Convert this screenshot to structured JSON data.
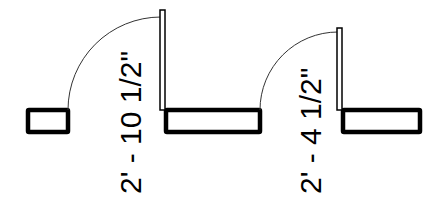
{
  "diagram": {
    "type": "architectural-door-plan",
    "colors": {
      "background": "#ffffff",
      "wall": "#000000",
      "door_leaf": "#000000",
      "swing_arc": "#333333",
      "text": "#000000"
    },
    "walls": [
      {
        "id": "wall-left",
        "x": 28,
        "y": 110,
        "w": 40,
        "h": 22
      },
      {
        "id": "wall-middle",
        "x": 166,
        "y": 110,
        "w": 94,
        "h": 22
      },
      {
        "id": "wall-right",
        "x": 343,
        "y": 110,
        "w": 77,
        "h": 22
      }
    ],
    "doors": [
      {
        "id": "door-1",
        "dimension_label": "2' - 10 1/2\"",
        "leaf": {
          "x": 160,
          "y": 10,
          "w": 5,
          "h": 100
        },
        "arc": {
          "cx": 161,
          "cy": 110,
          "r": 93
        },
        "label_pos": {
          "x": 141,
          "y": 194
        }
      },
      {
        "id": "door-2",
        "dimension_label": "2' - 4 1/2\"",
        "leaf": {
          "x": 337,
          "y": 28,
          "w": 5,
          "h": 82
        },
        "arc": {
          "cx": 338,
          "cy": 110,
          "r": 78
        },
        "label_pos": {
          "x": 321,
          "y": 194
        }
      }
    ]
  }
}
